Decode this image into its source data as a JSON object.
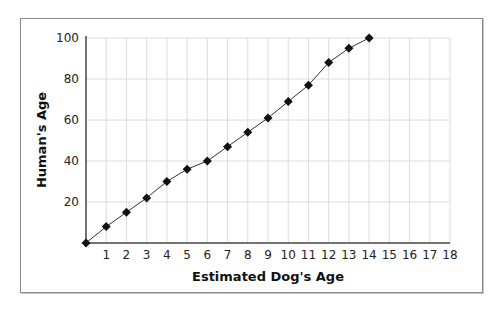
{
  "chart_data": {
    "type": "line",
    "title": "",
    "xlabel": "Estimated Dog's Age",
    "ylabel": "Human's Age",
    "x": [
      0,
      1,
      2,
      3,
      4,
      5,
      6,
      7,
      8,
      9,
      10,
      11,
      12,
      13,
      14
    ],
    "series": [
      {
        "name": "Human's Age",
        "values": [
          0,
          8,
          15,
          22,
          30,
          36,
          40,
          47,
          54,
          61,
          69,
          77,
          88,
          95,
          100
        ],
        "marker": "diamond",
        "color": "#111111"
      }
    ],
    "xlim": [
      0,
      18
    ],
    "ylim": [
      0,
      100
    ],
    "xticks": [
      1,
      2,
      3,
      4,
      5,
      6,
      7,
      8,
      9,
      10,
      11,
      12,
      13,
      14,
      15,
      16,
      17,
      18
    ],
    "yticks": [
      20,
      40,
      60,
      80,
      100
    ],
    "grid": true,
    "legend": "none"
  },
  "colors": {
    "grid": "#dcdcdc",
    "axis": "#444444",
    "line": "#333333",
    "marker": "#111111"
  }
}
